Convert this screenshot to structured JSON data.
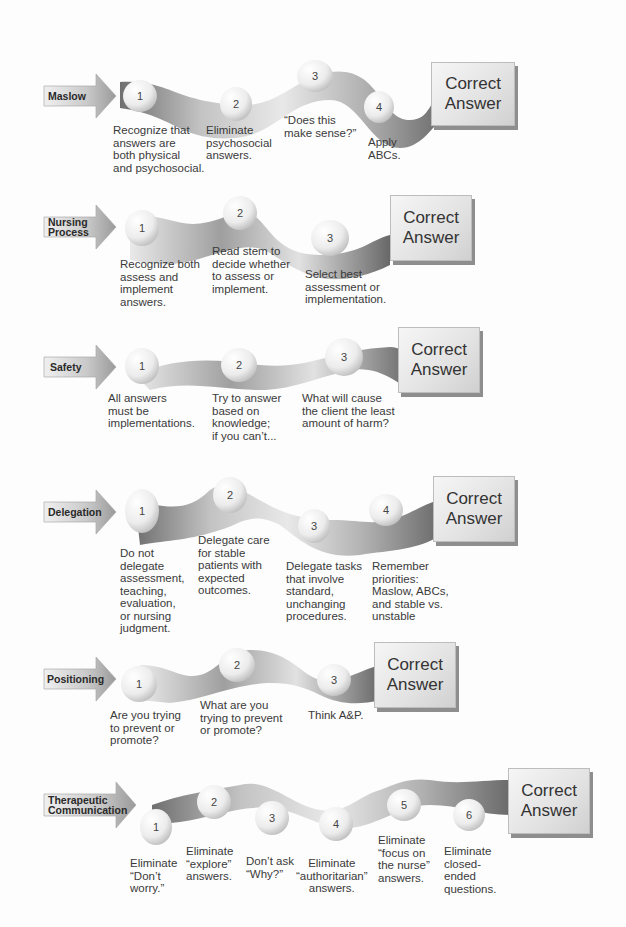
{
  "answer_label": {
    "line1": "Correct",
    "line2": "Answer"
  },
  "colors": {
    "ribbon_dark": "#6e6e6e",
    "ribbon_light": "#e4e4e4",
    "node_fill": "#f4f4f4",
    "arrow_fill": "#d8d8d8"
  },
  "strategies": [
    {
      "name": "Maslow",
      "steps": [
        {
          "num": "1",
          "text": "Recognize that\nanswers are\nboth physical\nand psychosocial."
        },
        {
          "num": "2",
          "text": "Eliminate\npsychosocial\nanswers."
        },
        {
          "num": "3",
          "text": "“Does this\nmake sense?”"
        },
        {
          "num": "4",
          "text": "Apply\nABCs."
        }
      ]
    },
    {
      "name_line1": "Nursing",
      "name_line2": "Process",
      "steps": [
        {
          "num": "1",
          "text": "Recognize both\nassess and\nimplement\nanswers."
        },
        {
          "num": "2",
          "text": "Read stem to\ndecide whether\nto assess or\nimplement."
        },
        {
          "num": "3",
          "text": "Select best\nassessment or\nimplementation."
        }
      ]
    },
    {
      "name": "Safety",
      "steps": [
        {
          "num": "1",
          "text": "All answers\nmust be\nimplementations."
        },
        {
          "num": "2",
          "text": "Try to answer\nbased on\nknowledge;\nif you can’t..."
        },
        {
          "num": "3",
          "text": "What will cause\nthe client the least\namount of harm?"
        }
      ]
    },
    {
      "name": "Delegation",
      "steps": [
        {
          "num": "1",
          "text": "Do not\ndelegate\nassessment,\nteaching,\nevaluation,\nor nursing\njudgment."
        },
        {
          "num": "2",
          "text": "Delegate care\nfor stable\npatients with\nexpected\noutcomes."
        },
        {
          "num": "3",
          "text": "Delegate tasks\nthat involve\nstandard,\nunchanging\nprocedures."
        },
        {
          "num": "4",
          "text": "Remember\npriorities:\nMaslow, ABCs,\nand stable vs.\nunstable"
        }
      ]
    },
    {
      "name": "Positioning",
      "steps": [
        {
          "num": "1",
          "text": "Are you trying\nto prevent or\npromote?"
        },
        {
          "num": "2",
          "text": "What are you\ntrying to prevent\nor promote?"
        },
        {
          "num": "3",
          "text": "Think A&P."
        }
      ]
    },
    {
      "name_line1": "Therapeutic",
      "name_line2": "Communication",
      "steps": [
        {
          "num": "1",
          "text": "Eliminate\n“Don’t\nworry.”"
        },
        {
          "num": "2",
          "text": "Eliminate\n“explore”\nanswers."
        },
        {
          "num": "3",
          "text": "Don’t ask\n“Why?”"
        },
        {
          "num": "4",
          "text": "Eliminate\n“authoritarian”\nanswers."
        },
        {
          "num": "5",
          "text": "Eliminate\n“focus on\nthe nurse”\nanswers."
        },
        {
          "num": "6",
          "text": "Eliminate\nclosed-\nended\nquestions."
        }
      ]
    }
  ]
}
